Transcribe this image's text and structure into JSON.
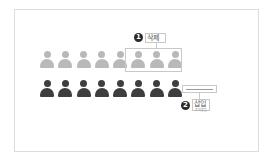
{
  "diagram": {
    "rows": [
      {
        "name": "original-row",
        "color": "#b9b9b9",
        "count": 8
      },
      {
        "name": "result-row",
        "color": "#3e3e3e",
        "count": 8
      }
    ],
    "annotations": [
      {
        "number": "1",
        "label": "삭제",
        "target": "last three people of top row"
      },
      {
        "number": "2",
        "label": "삽입",
        "sublabel": "추가 삽입",
        "target": "slot after bottom row"
      }
    ],
    "colors": {
      "light_person": "#b9b9b9",
      "dark_person": "#3e3e3e",
      "badge": "#2b2b2b",
      "border": "#c8c8c8"
    }
  }
}
